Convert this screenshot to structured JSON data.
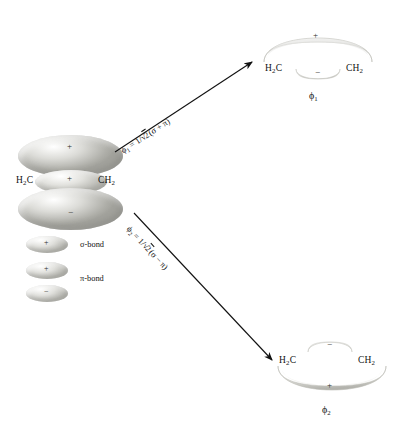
{
  "figure": {
    "type": "molecular-orbital-diagram",
    "background_color": "#ffffff",
    "ink_color": "#111111",
    "lobe_color": "#cccac5"
  },
  "reactant": {
    "name": "sigma-pi-description",
    "left_atom": "H",
    "left_atom_sub": "2",
    "left_atom_tail": "C",
    "right_atom": "CH",
    "right_atom_sub": "2",
    "lobes": [
      {
        "sign": "+",
        "role": "pi-upper-lobe"
      },
      {
        "sign": "+",
        "role": "sigma-bond-lobe"
      },
      {
        "sign": "−",
        "role": "pi-lower-lobe"
      }
    ]
  },
  "legend": {
    "items": [
      {
        "label": "σ-bond",
        "sign": "+",
        "name": "sigma-bond"
      },
      {
        "label": "π-bond",
        "signs": [
          "+",
          "−"
        ],
        "name": "pi-bond"
      }
    ]
  },
  "arrows": [
    {
      "name": "arrow-to-phi1",
      "direction": "up-right",
      "equation_phi": "ϕ",
      "equation_sub": "1",
      "equation_rest_a": " = 1/",
      "equation_radical": "2",
      "equation_rest_b": "(σ + π)"
    },
    {
      "name": "arrow-to-phi2",
      "direction": "down-right",
      "equation_phi": "ϕ",
      "equation_sub": "2",
      "equation_rest_a": " = 1/",
      "equation_radical": "2",
      "equation_rest_b": "(σ − π)"
    }
  ],
  "products": [
    {
      "name": "phi1-orbital",
      "label_phi": "ϕ",
      "label_sub": "1",
      "left_atom": "H",
      "left_atom_sub": "2",
      "left_atom_tail": "C",
      "right_atom": "CH",
      "right_atom_sub": "2",
      "major_lobe_sign": "+",
      "major_lobe_position": "above",
      "minor_lobe_sign": "−",
      "minor_lobe_position": "below"
    },
    {
      "name": "phi2-orbital",
      "label_phi": "ϕ",
      "label_sub": "2",
      "left_atom": "H",
      "left_atom_sub": "2",
      "left_atom_tail": "C",
      "right_atom": "CH",
      "right_atom_sub": "2",
      "major_lobe_sign": "+",
      "major_lobe_position": "below",
      "minor_lobe_sign": "−",
      "minor_lobe_position": "above"
    }
  ]
}
